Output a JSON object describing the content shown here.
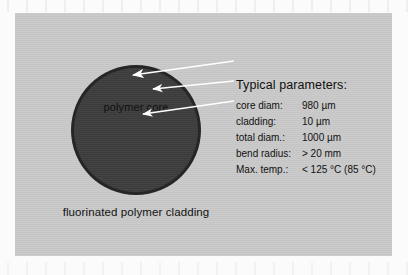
{
  "figure": {
    "panel_bg_color": "#c9c9c9",
    "diagram": {
      "core_label": "polymer core",
      "cladding_label": "fluorinated polymer cladding",
      "core_color": "#3e3e3e",
      "cladding_ring_color": "#262626",
      "arrow_color": "#ffffff",
      "arrows": [
        {
          "name": "core-diam-arrow",
          "target": "core diam",
          "x1": 219,
          "y1": 48,
          "x2": 117,
          "y2": 62
        },
        {
          "name": "cladding-arrow",
          "target": "cladding",
          "x1": 219,
          "y1": 68,
          "x2": 136,
          "y2": 76
        },
        {
          "name": "total-diam-arrow",
          "target": "total diam.",
          "x1": 219,
          "y1": 88,
          "x2": 127,
          "y2": 101
        }
      ]
    },
    "parameters": {
      "heading": "Typical parameters:",
      "rows": [
        {
          "label": "core diam:",
          "value": "980 µm"
        },
        {
          "label": "cladding:",
          "value": "10 µm"
        },
        {
          "label": "total diam.:",
          "value": "1000 µm"
        },
        {
          "label": "bend radius:",
          "value": "> 20 mm"
        },
        {
          "label": "Max. temp.:",
          "value": "< 125 °C (85 °C)"
        }
      ]
    }
  }
}
